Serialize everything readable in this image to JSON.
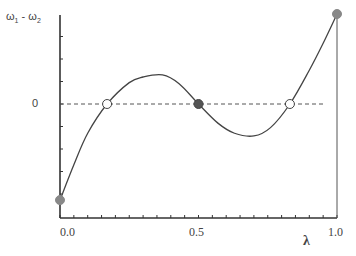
{
  "chart_data": {
    "type": "line",
    "title": "",
    "xlabel": "λ",
    "ylabel": "ω₁ - ω₂",
    "y_label_parts": {
      "w1": "ω",
      "sub1": "1",
      "sep": " - ",
      "w2": "ω",
      "sub2": "2"
    },
    "xlim": [
      0.0,
      1.0
    ],
    "ylim": [
      -5.0,
      4.0
    ],
    "x_ticks": [
      {
        "value": 0.0,
        "label": "0.0"
      },
      {
        "value": 0.5,
        "label": "0.5"
      },
      {
        "value": 1.0,
        "label": "1.0"
      }
    ],
    "x_minor_tick_step": 0.05,
    "y_ticks": [
      {
        "value": 0,
        "label": "0"
      }
    ],
    "y_minor_tick_step": 1,
    "grid": false,
    "legend": null,
    "reference_line": {
      "y": 0,
      "style": "dashed",
      "x_range": [
        0.0,
        0.96
      ]
    },
    "series": [
      {
        "name": "ω1 - ω2",
        "style": "solid",
        "x": [
          0.0,
          0.05,
          0.1,
          0.17,
          0.25,
          0.3,
          0.37,
          0.43,
          0.5,
          0.57,
          0.63,
          0.7,
          0.76,
          0.83,
          0.9,
          0.95,
          1.0
        ],
        "values": [
          -4.27,
          -2.7,
          -1.3,
          0.0,
          0.95,
          1.2,
          1.29,
          0.9,
          0.0,
          -0.85,
          -1.3,
          -1.42,
          -1.05,
          0.0,
          1.5,
          2.7,
          4.0
        ]
      }
    ],
    "markers": [
      {
        "x": 0.0,
        "y": -4.27,
        "fill": "gray",
        "label": "endpoint λ=0"
      },
      {
        "x": 0.17,
        "y": 0.0,
        "fill": "open",
        "label": "unstable root"
      },
      {
        "x": 0.5,
        "y": 0.0,
        "fill": "filled",
        "label": "stable root"
      },
      {
        "x": 0.83,
        "y": 0.0,
        "fill": "open",
        "label": "unstable root"
      },
      {
        "x": 1.0,
        "y": 4.0,
        "fill": "gray",
        "label": "endpoint λ=1"
      }
    ],
    "annotations": [
      {
        "type": "vertical_line",
        "x": 1.0,
        "from_y": -5.0,
        "to_y": 4.0
      }
    ]
  },
  "colors": {
    "axis": "#333333",
    "curve": "#444444",
    "dashed": "#555555",
    "filled_marker": "#555555",
    "gray_marker": "#888888",
    "open_marker_fill": "#ffffff"
  }
}
